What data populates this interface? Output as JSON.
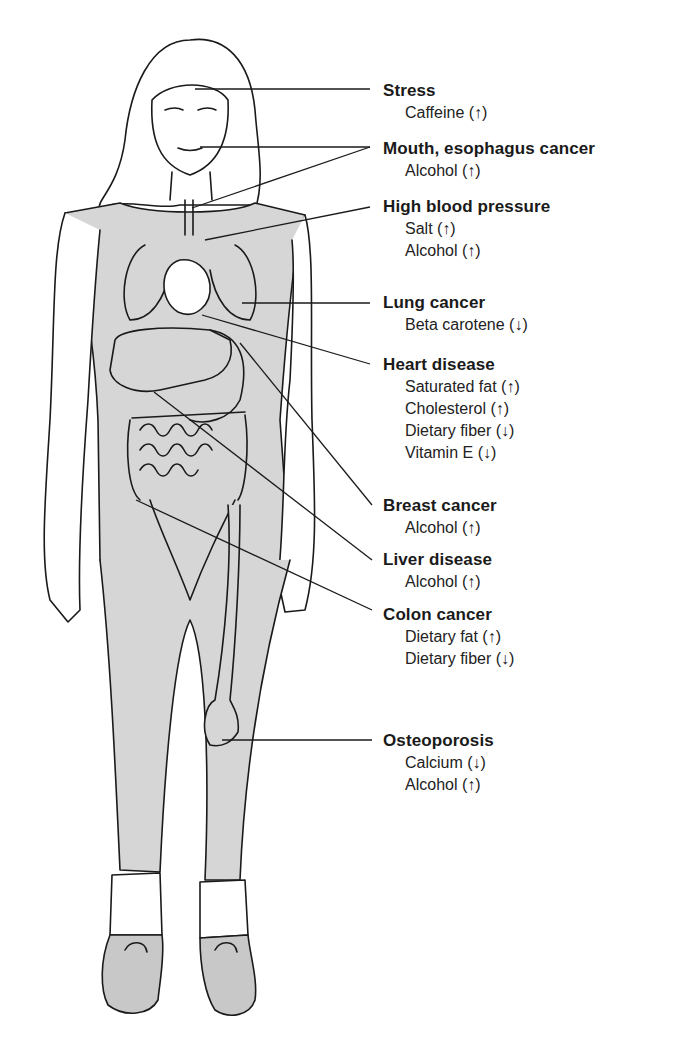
{
  "diagram": {
    "colors": {
      "fill": "#d6d6d6",
      "stroke": "#1a1a1a",
      "background": "#ffffff"
    },
    "conditions": [
      {
        "name": "Stress",
        "top": 80,
        "factors": [
          "Caffeine (↑)"
        ]
      },
      {
        "name": "Mouth, esophagus cancer",
        "top": 138,
        "factors": [
          "Alcohol (↑)"
        ]
      },
      {
        "name": "High blood pressure",
        "top": 196,
        "factors": [
          "Salt (↑)",
          "Alcohol (↑)"
        ]
      },
      {
        "name": "Lung cancer",
        "top": 298,
        "factors": [
          "Beta carotene (↓)"
        ]
      },
      {
        "name": "Heart disease",
        "top": 360,
        "factors": [
          "Saturated fat (↑)",
          "Cholesterol (↑)",
          "Dietary fiber (↓)",
          "Vitamin E (↓)"
        ]
      },
      {
        "name": "Breast cancer",
        "top": 496,
        "factors": [
          "Alcohol (↑)"
        ]
      },
      {
        "name": "Liver disease",
        "top": 550,
        "factors": [
          "Alcohol (↑)"
        ]
      },
      {
        "name": "Colon cancer",
        "top": 604,
        "factors": [
          "Dietary fat (↑)",
          "Dietary fiber (↓)"
        ]
      },
      {
        "name": "Osteoporosis",
        "top": 728,
        "factors": [
          "Calcium (↓)",
          "Alcohol (↑)"
        ]
      }
    ]
  }
}
